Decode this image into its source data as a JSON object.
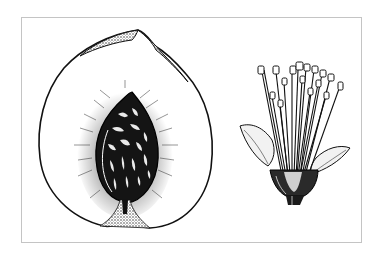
{
  "illustration": {
    "style": "black-and-white botanical line drawing",
    "frame_color": "#c4c4c4",
    "ink_color": "#111111",
    "background_color": "#ffffff",
    "figures": [
      {
        "id": "fruit-section",
        "subject": "peach fruit cut in half showing pitted stone"
      },
      {
        "id": "flower-section",
        "subject": "peach flower with stamens and sepals, petals removed"
      }
    ]
  }
}
